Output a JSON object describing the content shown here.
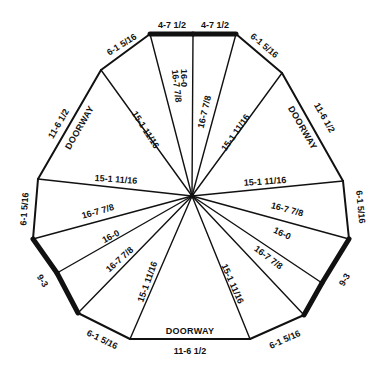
{
  "diagram": {
    "center": [
      192,
      196
    ],
    "vertices": [
      [
        150,
        34
      ],
      [
        193,
        34
      ],
      [
        236,
        34
      ],
      [
        282,
        73
      ],
      [
        343,
        181
      ],
      [
        349,
        239
      ],
      [
        322,
        283
      ],
      [
        304,
        315
      ],
      [
        250,
        339
      ],
      [
        130,
        339
      ],
      [
        78,
        313
      ],
      [
        57,
        273
      ],
      [
        33,
        239
      ],
      [
        38,
        179
      ],
      [
        101,
        70
      ]
    ],
    "edges": [
      {
        "from": 0,
        "to": 1,
        "thick": true
      },
      {
        "from": 1,
        "to": 2,
        "thick": true
      },
      {
        "from": 2,
        "to": 3,
        "thick": false
      },
      {
        "from": 3,
        "to": 4,
        "thick": false
      },
      {
        "from": 4,
        "to": 5,
        "thick": false
      },
      {
        "from": 5,
        "to": 6,
        "thick": true
      },
      {
        "from": 6,
        "to": 7,
        "thick": true
      },
      {
        "from": 7,
        "to": 8,
        "thick": false
      },
      {
        "from": 8,
        "to": 9,
        "thick": false
      },
      {
        "from": 9,
        "to": 10,
        "thick": false
      },
      {
        "from": 10,
        "to": 11,
        "thick": true
      },
      {
        "from": 11,
        "to": 12,
        "thick": true
      },
      {
        "from": 12,
        "to": 13,
        "thick": false
      },
      {
        "from": 13,
        "to": 14,
        "thick": false
      },
      {
        "from": 14,
        "to": 0,
        "thick": false
      }
    ],
    "edge_labels": [
      {
        "text": "4-7 1/2",
        "x": 172,
        "y": 26,
        "angle": 0
      },
      {
        "text": "4-7 1/2",
        "x": 215,
        "y": 26,
        "angle": 0
      },
      {
        "text": "6-1 5/16",
        "x": 264,
        "y": 46,
        "angle": 40
      },
      {
        "text": "11-6 1/2",
        "x": 324,
        "y": 118,
        "angle": 60
      },
      {
        "text": "DOORWAY",
        "x": 302,
        "y": 128,
        "angle": 60,
        "door": true
      },
      {
        "text": "6-1 5/16",
        "x": 360,
        "y": 207,
        "angle": 84
      },
      {
        "text": "9-3",
        "x": 345,
        "y": 280,
        "angle": -59
      },
      {
        "text": "6-1 5/16",
        "x": 285,
        "y": 340,
        "angle": -24
      },
      {
        "text": "DOORWAY",
        "x": 190,
        "y": 332,
        "angle": 0,
        "door": true
      },
      {
        "text": "11-6 1/2",
        "x": 190,
        "y": 352,
        "angle": 0
      },
      {
        "text": "6-1 5/16",
        "x": 102,
        "y": 340,
        "angle": 26
      },
      {
        "text": "9-3",
        "x": 42,
        "y": 281,
        "angle": 59
      },
      {
        "text": "6-1 5/16",
        "x": 25,
        "y": 209,
        "angle": -86
      },
      {
        "text": "11-6 1/2",
        "x": 59,
        "y": 124,
        "angle": -60
      },
      {
        "text": "DOORWAY",
        "x": 80,
        "y": 128,
        "angle": -60,
        "door": true
      },
      {
        "text": "6-1 5/16",
        "x": 122,
        "y": 45,
        "angle": -32
      }
    ],
    "spokes": [
      {
        "to": 0,
        "label": "",
        "lx": 0,
        "ly": 0,
        "angle": 0
      },
      {
        "to": 1,
        "label": "",
        "lx": 0,
        "ly": 0,
        "angle": 0
      },
      {
        "to": 2,
        "label": "16-7 7/8",
        "lx": 205,
        "ly": 112,
        "angle": -77
      },
      {
        "to": 3,
        "label": "15-1 11/16",
        "lx": 236,
        "ly": 133,
        "angle": -55
      },
      {
        "to": 4,
        "label": "15-1 11/16",
        "lx": 265,
        "ly": 182,
        "angle": -4
      },
      {
        "to": 5,
        "label": "16-7 7/8",
        "lx": 287,
        "ly": 210,
        "angle": 15
      },
      {
        "to": 6,
        "label": "16-0",
        "lx": 282,
        "ly": 234,
        "angle": 25
      },
      {
        "to": 7,
        "label": "16-7 7/8",
        "lx": 268,
        "ly": 258,
        "angle": 37
      },
      {
        "to": 8,
        "label": "15-1 11/16",
        "lx": 232,
        "ly": 284,
        "angle": 66
      },
      {
        "to": 9,
        "label": "15-1 11/16",
        "lx": 148,
        "ly": 282,
        "angle": -70
      },
      {
        "to": 10,
        "label": "16-7 7/8",
        "lx": 120,
        "ly": 260,
        "angle": -42
      },
      {
        "to": 11,
        "label": "16-0",
        "lx": 111,
        "ly": 237,
        "angle": -28
      },
      {
        "to": 12,
        "label": "16-7 7/8",
        "lx": 98,
        "ly": 212,
        "angle": -16
      },
      {
        "to": 13,
        "label": "15-1 11/16",
        "lx": 116,
        "ly": 180,
        "angle": 4
      },
      {
        "to": 14,
        "label": "15-1 11/16",
        "lx": 145,
        "ly": 130,
        "angle": 57
      }
    ],
    "inner_labels": [
      {
        "text": "16-0",
        "x": 183,
        "y": 78,
        "angle": 90
      },
      {
        "text": "16-7 7/8",
        "x": 176,
        "y": 86,
        "angle": 83
      }
    ],
    "colors": {
      "line": "#111111",
      "background": "#ffffff"
    }
  }
}
